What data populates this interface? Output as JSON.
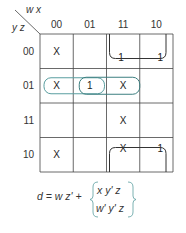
{
  "kmap": {
    "row_var_label": "y z",
    "col_var_label": "w x",
    "col_headers": [
      "00",
      "01",
      "11",
      "10"
    ],
    "row_headers": [
      "00",
      "01",
      "11",
      "10"
    ],
    "cells": [
      [
        "X",
        "",
        "1",
        "1"
      ],
      [
        "X",
        "1",
        "X",
        ""
      ],
      [
        "",
        "",
        "X",
        ""
      ],
      [
        "X",
        "",
        "X",
        "1"
      ]
    ],
    "groups": [
      {
        "name": "wz-prime-wrap",
        "color": "#333333"
      },
      {
        "name": "w-prime-y-prime-z",
        "color": "#5a9ea0"
      },
      {
        "name": "x-y-prime-z",
        "color": "#3d7f80"
      }
    ]
  },
  "equation": {
    "lhs": "d = w z' +",
    "option_1": "x y' z",
    "option_2": "w' y' z",
    "option_1_color": "#3d7f80",
    "option_2_color": "#7fb8ba"
  }
}
